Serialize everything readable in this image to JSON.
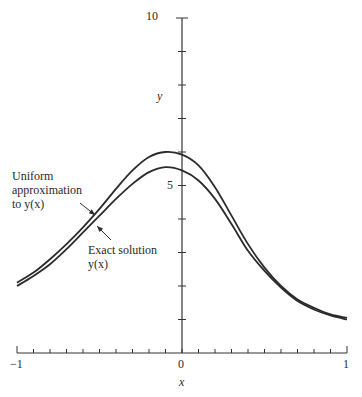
{
  "chart_data": {
    "type": "line",
    "title": "",
    "xlabel": "x",
    "ylabel": "y",
    "xlim": [
      -1,
      1
    ],
    "ylim": [
      0,
      10
    ],
    "x_tick_labels": [
      "-1",
      "0",
      "1"
    ],
    "x_minor_tick_step": 0.1,
    "y_tick_labels": [
      "5",
      "10"
    ],
    "y_minor_tick_step": 1,
    "grid": false,
    "legend": "annotations with arrows",
    "x": [
      -1.0,
      -0.9,
      -0.8,
      -0.7,
      -0.6,
      -0.5,
      -0.4,
      -0.3,
      -0.2,
      -0.1,
      0.0,
      0.1,
      0.2,
      0.3,
      0.4,
      0.5,
      0.6,
      0.7,
      0.8,
      0.9,
      1.0
    ],
    "series": [
      {
        "name": "Uniform approximation to y(x)",
        "values": [
          2.1,
          2.4,
          2.8,
          3.25,
          3.75,
          4.3,
          4.9,
          5.45,
          5.85,
          6.0,
          5.92,
          5.6,
          4.95,
          4.1,
          3.25,
          2.55,
          2.0,
          1.6,
          1.35,
          1.15,
          1.05
        ]
      },
      {
        "name": "Exact solution y(x)",
        "values": [
          2.0,
          2.3,
          2.65,
          3.1,
          3.6,
          4.1,
          4.6,
          5.05,
          5.4,
          5.55,
          5.45,
          5.15,
          4.6,
          3.85,
          3.05,
          2.45,
          1.95,
          1.55,
          1.3,
          1.12,
          1.0
        ]
      }
    ],
    "annotations": [
      {
        "text_lines": [
          "Uniform",
          "approximation",
          "to y(x)"
        ],
        "points_to": "Uniform approximation to y(x)",
        "at_x": -0.47
      },
      {
        "text_lines": [
          "Exact solution",
          "y(x)"
        ],
        "points_to": "Exact solution y(x)",
        "at_x": -0.43
      }
    ]
  },
  "labels": {
    "y_axis": "y",
    "x_axis": "x",
    "y_tick_10": "10",
    "y_tick_5": "5",
    "x_tick_neg1": "−1",
    "x_tick_0": "0",
    "x_tick_1": "1",
    "uniform_line1": "Uniform",
    "uniform_line2": "approximation",
    "uniform_line3": "to y(x)",
    "exact_line1": "Exact solution",
    "exact_line2": "y(x)"
  },
  "style": {
    "line_color": "#2b2b2b",
    "axis_color": "#333333"
  }
}
